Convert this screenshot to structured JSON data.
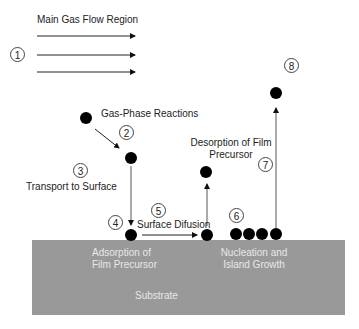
{
  "diagram": {
    "title": "Main Gas Flow Region",
    "substrate_label": "Substrate",
    "substrate_color": "#999999",
    "steps": [
      {
        "number": "1",
        "label": "Main Gas Flow Region"
      },
      {
        "number": "2",
        "label": "Gas-Phase Reactions"
      },
      {
        "number": "3",
        "label": "Transport to Surface"
      },
      {
        "number": "4",
        "label": "Adsorption of Film Precursor"
      },
      {
        "number": "5",
        "label": "Surface Difusion"
      },
      {
        "number": "6",
        "label": "Nucleation and Island Growth"
      },
      {
        "number": "7",
        "label": "Desorption of Film Precursor"
      },
      {
        "number": "8",
        "label": ""
      }
    ],
    "labels": {
      "gas_phase": "Gas-Phase Reactions",
      "transport": "Transport to Surface",
      "surface_diffusion": "Surface Difusion",
      "desorption_line1": "Desorption of Film",
      "desorption_line2": "Precursor",
      "adsorption_line1": "Adsorption of",
      "adsorption_line2": "Film Precursor",
      "nucleation_line1": "Nucleation and",
      "nucleation_line2": "Island Growth"
    }
  }
}
